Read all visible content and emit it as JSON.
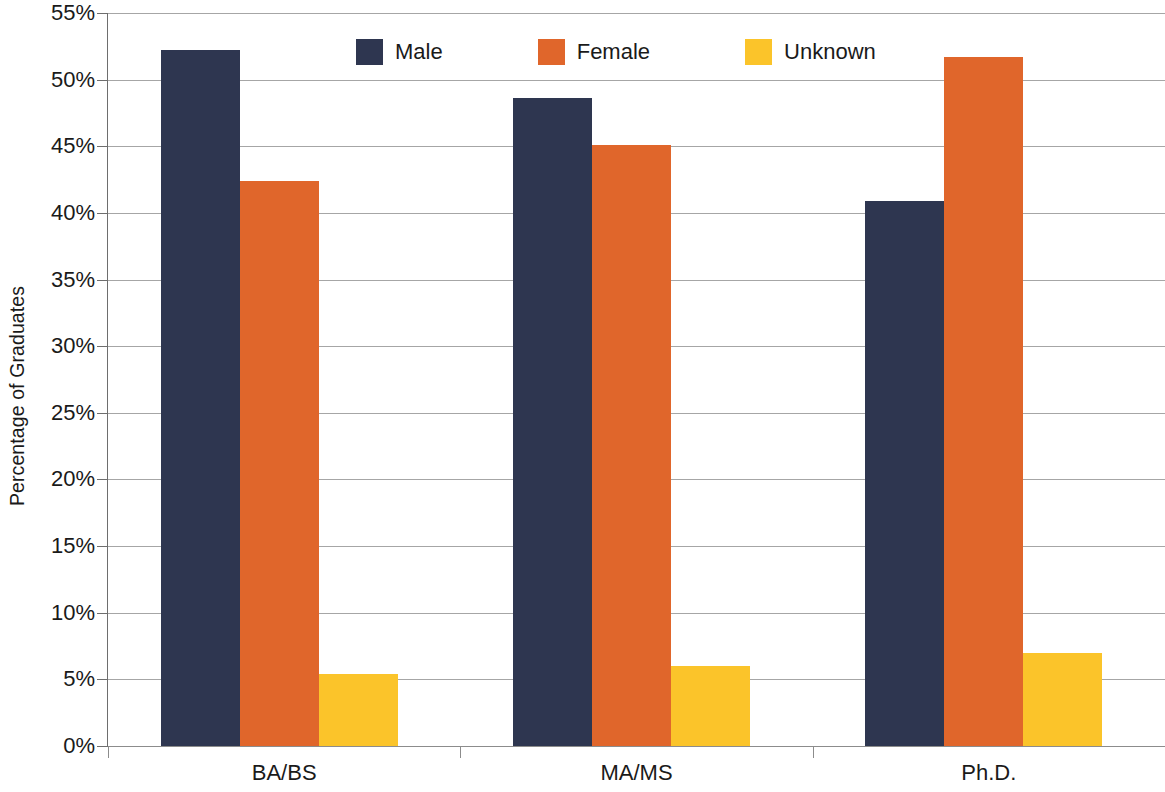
{
  "chart_data": {
    "type": "bar",
    "title": "",
    "subtitle": "",
    "xlabel": "",
    "ylabel": "Percentage of Graduates",
    "categories": [
      "BA/BS",
      "MA/MS",
      "Ph.D."
    ],
    "series": [
      {
        "name": "Male",
        "color": "#2e3650",
        "values": [
          52.2,
          48.6,
          40.9
        ]
      },
      {
        "name": "Female",
        "color": "#e0662b",
        "values": [
          42.4,
          45.1,
          51.7
        ]
      },
      {
        "name": "Unknown",
        "color": "#fbc42a",
        "values": [
          5.4,
          6.0,
          7.0
        ]
      }
    ],
    "ylim": [
      0,
      55
    ],
    "y_tick_step": 5,
    "y_tick_labels": [
      "0%",
      "5%",
      "10%",
      "15%",
      "20%",
      "25%",
      "30%",
      "35%",
      "40%",
      "45%",
      "50%",
      "55%"
    ],
    "y_tick_values": [
      0,
      5,
      10,
      15,
      20,
      25,
      30,
      35,
      40,
      45,
      50,
      55
    ],
    "grid": true,
    "grid_color": "#a6a6a6",
    "legend_position": "top-center",
    "legend": [
      "Male",
      "Female",
      "Unknown"
    ],
    "background": "#ffffff",
    "axis_color": "#6e6e6e",
    "text_color": "#1a1a1a"
  }
}
